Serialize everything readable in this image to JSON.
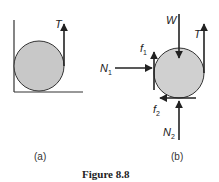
{
  "figure": {
    "caption": "Figure 8.8",
    "panels": [
      {
        "id": "a",
        "label": "(a)",
        "forces": [
          {
            "name": "T",
            "label": "T"
          }
        ]
      },
      {
        "id": "b",
        "label": "(b)",
        "forces": [
          {
            "name": "W",
            "label": "W"
          },
          {
            "name": "T",
            "label": "T"
          },
          {
            "name": "N1",
            "label": "N",
            "sub": "1"
          },
          {
            "name": "f1",
            "label": "f",
            "sub": "1"
          },
          {
            "name": "f2",
            "label": "f",
            "sub": "2"
          },
          {
            "name": "N2",
            "label": "N",
            "sub": "2"
          }
        ]
      }
    ],
    "colors": {
      "disk_fill": "#c8c8c8",
      "stroke": "#222222"
    }
  }
}
